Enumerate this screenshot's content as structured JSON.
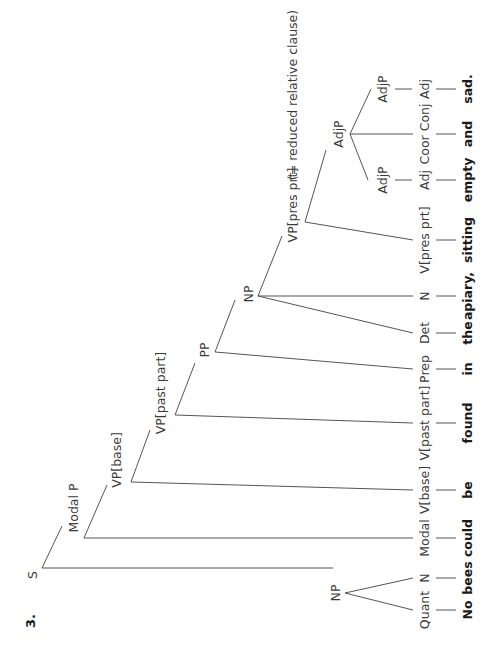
{
  "figure": {
    "number": "3.",
    "orientation": "rotated 90° counterclockwise",
    "sentence": "No bees could be found in the apiary, sitting empty and sad."
  },
  "tree": {
    "root": "S",
    "nodes": {
      "s": "S",
      "np_subject": "NP",
      "modal_p": "Modal P",
      "vp_base": "VP[base]",
      "vp_past_part": "VP[past part]",
      "pp": "PP",
      "np_object": "NP",
      "vp_pres_prt": "VP[pres prt]",
      "vp_pres_prt_note": "(= reduced relative clause)",
      "adjp_coord": "AdjP",
      "adjp_1": "AdjP",
      "adjp_2": "AdjP"
    },
    "leaves": [
      {
        "category": "Quant",
        "word": "No"
      },
      {
        "category": "N",
        "word": "bees"
      },
      {
        "category": "Modal",
        "word": "could"
      },
      {
        "category": "V[base]",
        "word": "be"
      },
      {
        "category": "V[past part]",
        "word": "found"
      },
      {
        "category": "Prep",
        "word": "in"
      },
      {
        "category": "Det",
        "word": "the"
      },
      {
        "category": "N",
        "word": "apiary,"
      },
      {
        "category": "V[pres prt]",
        "word": "sitting"
      },
      {
        "category": "Adj",
        "word": "empty"
      },
      {
        "category": "Coor Conj",
        "word": "and"
      },
      {
        "category": "Adj",
        "word": "sad."
      }
    ]
  },
  "colors": {
    "line": "#555555",
    "label": "#3a3a3a",
    "word": "#1a1a1a",
    "background": "#ffffff"
  }
}
